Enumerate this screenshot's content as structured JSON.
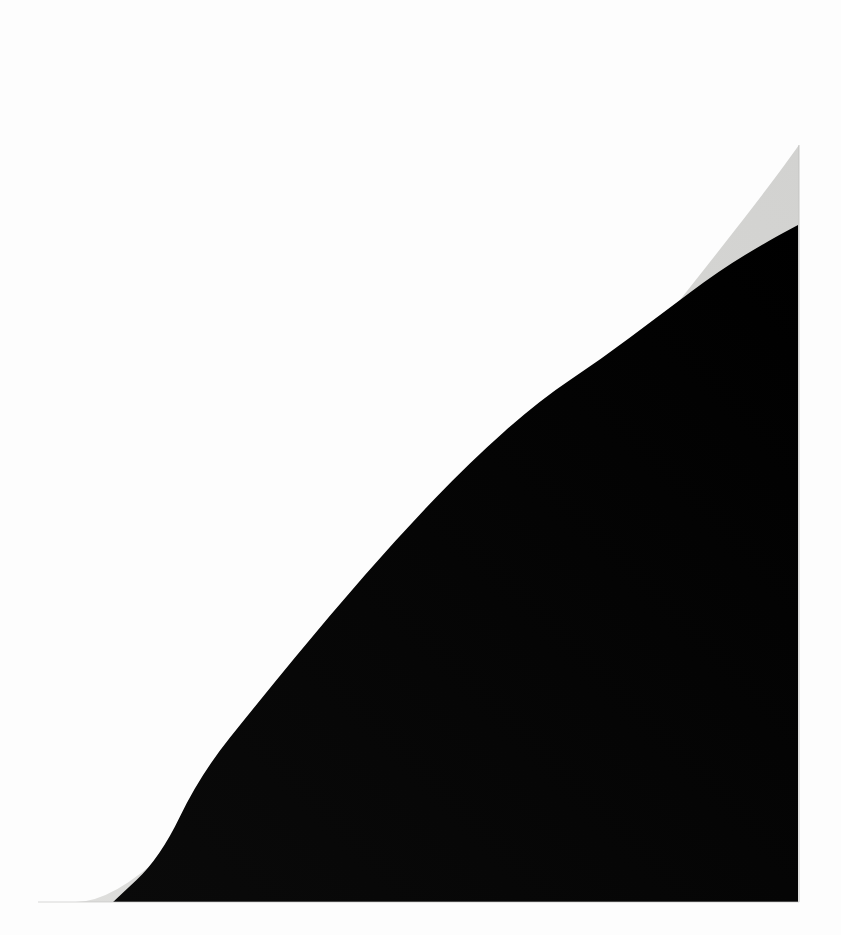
{
  "document": {
    "kind": "scanned-page-photograph",
    "caption": "",
    "page_label": "",
    "visible_text": "",
    "width": 841,
    "height": 935
  },
  "colors": {
    "background": "#fdfdfd",
    "paper_gray": "#d7d7d5",
    "paper_gray_light": "#dedddb",
    "paper_gray_dark": "#cfcfcd",
    "ink_black": "#050505",
    "ink_black_soft": "#0b0b0b",
    "edge_shadow": "#bdbdbb"
  },
  "regions": {
    "background": {
      "name": "scanner-backdrop",
      "color": "#fdfdfd",
      "description": "near-white empty backdrop surrounding the page"
    },
    "paper": {
      "name": "paper-sliver",
      "color": "#d7d7d5",
      "description": "light gray curved wedge of page margin visible between backdrop and ink",
      "apex": [
        799,
        145
      ],
      "tip": [
        38,
        902
      ],
      "right_edge_x": 799,
      "bottom_edge_y": 902
    },
    "ink": {
      "name": "black-ink-field",
      "color": "#050505",
      "description": "large solid black printed field with a concave-up curved upper-left boundary",
      "right_edge_x": 798,
      "bottom_edge_y": 902,
      "bottom_left_x": 113,
      "top_right_y": 225
    }
  },
  "geometry": {
    "paper_outline_points": [
      [
        38,
        902
      ],
      [
        113,
        902
      ],
      [
        220,
        800
      ],
      [
        340,
        680
      ],
      [
        470,
        545
      ],
      [
        600,
        400
      ],
      [
        700,
        275
      ],
      [
        770,
        185
      ],
      [
        799,
        145
      ],
      [
        799,
        902
      ]
    ],
    "ink_boundary_points": [
      [
        113,
        902
      ],
      [
        160,
        858
      ],
      [
        200,
        775
      ],
      [
        260,
        700
      ],
      [
        330,
        615
      ],
      [
        400,
        535
      ],
      [
        470,
        462
      ],
      [
        540,
        400
      ],
      [
        600,
        360
      ],
      [
        660,
        315
      ],
      [
        720,
        270
      ],
      [
        770,
        240
      ],
      [
        798,
        225
      ]
    ],
    "ink_right_edge_x": 798,
    "ink_bottom_edge_y": 902
  },
  "chart_data": {
    "type": "area",
    "title": "",
    "xlabel": "",
    "ylabel": "",
    "grid": false,
    "legend": "none",
    "xlim": [
      0,
      841
    ],
    "ylim": [
      935,
      0
    ],
    "series": [
      {
        "name": "paper-upper-edge",
        "color": "#d7d7d5",
        "x": [
          38,
          113,
          220,
          340,
          470,
          600,
          700,
          770,
          799
        ],
        "y": [
          902,
          860,
          775,
          650,
          510,
          375,
          270,
          185,
          145
        ]
      },
      {
        "name": "ink-upper-edge",
        "color": "#050505",
        "x": [
          113,
          200,
          330,
          400,
          470,
          540,
          600,
          720,
          798
        ],
        "y": [
          902,
          775,
          615,
          535,
          462,
          400,
          360,
          270,
          225
        ]
      }
    ]
  }
}
